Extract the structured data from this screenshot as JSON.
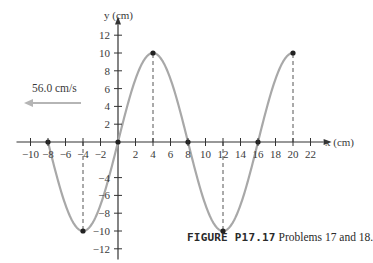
{
  "figure": {
    "caption_label": "FIGURE P17.17",
    "caption_text": "Problems 17 and 18.",
    "velocity_label": "56.0 cm/s",
    "velocity_direction": "left",
    "colors": {
      "curve": "#a8a8a8",
      "axis": "#333333",
      "arrow": "#b0b0b0",
      "point": "#222222"
    }
  },
  "chart_data": {
    "type": "line",
    "title": "FIGURE P17.17 Problems 17 and 18.",
    "xlabel": "x (cm)",
    "ylabel": "y (cm)",
    "xlim": [
      -10,
      22
    ],
    "ylim": [
      -12,
      12
    ],
    "grid": false,
    "x_ticks": [
      -10,
      -8,
      -6,
      -4,
      -2,
      2,
      4,
      6,
      8,
      10,
      12,
      14,
      16,
      18,
      20,
      22
    ],
    "y_ticks": [
      -12,
      -10,
      -8,
      -6,
      -4,
      2,
      4,
      6,
      8,
      10,
      12
    ],
    "series": [
      {
        "name": "wave",
        "description": "sinusoid y = 10 sin(pi x / 8), wavelength 16 cm, amplitude 10 cm",
        "x": [
          -8,
          -4,
          0,
          4,
          8,
          12,
          16,
          20
        ],
        "values": [
          0,
          -10,
          0,
          10,
          0,
          -10,
          0,
          10
        ]
      }
    ],
    "marked_points": [
      [
        -8,
        0
      ],
      [
        -4,
        -10
      ],
      [
        0,
        0
      ],
      [
        4,
        10
      ],
      [
        8,
        0
      ],
      [
        12,
        -10
      ],
      [
        16,
        0
      ],
      [
        20,
        10
      ]
    ],
    "dashed_guides_at_x": [
      -4,
      4,
      12,
      20
    ],
    "annotations": [
      {
        "text": "56.0 cm/s",
        "arrow": "pointing left (-x direction)"
      }
    ]
  }
}
